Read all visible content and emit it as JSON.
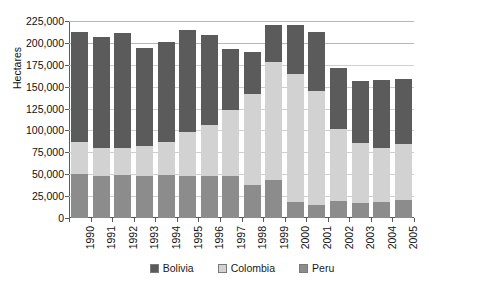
{
  "top_ghost_text": "",
  "axes": {
    "y_title": "Hectares",
    "y_ticks": [
      "0",
      "25,000",
      "50,000",
      "75,000",
      "100,000",
      "125,000",
      "150,000",
      "175,000",
      "200,000",
      "225,000"
    ]
  },
  "legend": {
    "items": [
      {
        "label": "Bolivia",
        "color": "#5b5b5b",
        "icon": "legend-swatch-bolivia"
      },
      {
        "label": "Colombia",
        "color": "#d2d2d2",
        "icon": "legend-swatch-colombia"
      },
      {
        "label": "Peru",
        "color": "#8c8c8c",
        "icon": "legend-swatch-peru"
      }
    ]
  },
  "chart_data": {
    "type": "bar",
    "stacked": true,
    "title": "",
    "xlabel": "",
    "ylabel": "Hectares",
    "ylim": [
      0,
      225000
    ],
    "ytick_step": 25000,
    "grid": true,
    "legend_position": "bottom",
    "categories": [
      "1990",
      "1991",
      "1992",
      "1993",
      "1994",
      "1995",
      "1996",
      "1997",
      "1998",
      "1999",
      "2000",
      "2001",
      "2002",
      "2003",
      "2004",
      "2005"
    ],
    "series": [
      {
        "name": "Peru",
        "color": "#8c8c8c",
        "values": [
          50000,
          48000,
          49000,
          48500,
          49000,
          48000,
          48500,
          48000,
          38000,
          43000,
          18000,
          14500,
          19000,
          17000,
          18500,
          20000
        ]
      },
      {
        "name": "Colombia",
        "color": "#d2d2d2",
        "values": [
          37000,
          32000,
          31000,
          34000,
          38000,
          50000,
          58000,
          75000,
          104000,
          135000,
          147000,
          130000,
          83000,
          69000,
          61000,
          65000
        ]
      },
      {
        "name": "Bolivia",
        "color": "#5b5b5b",
        "values": [
          125000,
          127000,
          131000,
          111500,
          114000,
          117000,
          102000,
          70000,
          48000,
          42000,
          56000,
          68000,
          69000,
          70000,
          78500,
          74000
        ]
      }
    ],
    "totals": [
      212000,
      207000,
      211000,
      194000,
      201000,
      215000,
      209000,
      193000,
      190000,
      220000,
      221000,
      212500,
      171000,
      156000,
      158000,
      159000
    ]
  }
}
